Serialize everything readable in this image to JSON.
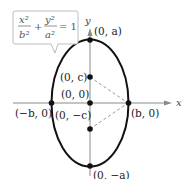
{
  "diagram": {
    "equation": {
      "term1_num": "x²",
      "term1_den": "b²",
      "term2_num": "y²",
      "term2_den": "a²",
      "plus": "+",
      "rhs": "= 1"
    },
    "axes": {
      "x_label": "x",
      "y_label": "y"
    },
    "points": {
      "top_vertex": "(0, a)",
      "bottom_vertex": "(0, −a)",
      "focus_upper": "(0, c)",
      "focus_lower": "(0, −c)",
      "center": "(0, 0)",
      "left_covertex": "(−b, 0)",
      "right_covertex": "(b, 0)"
    },
    "colors": {
      "ellipse": "#111111",
      "axes": "#888888",
      "dashed": "#999999",
      "callout_border": "#bbbbbb"
    }
  }
}
